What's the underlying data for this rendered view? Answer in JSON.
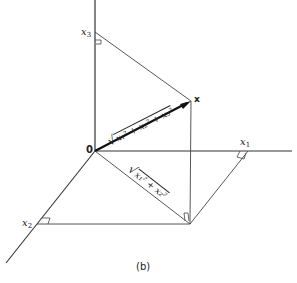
{
  "figure": {
    "caption": "(b)",
    "origin_label": "0",
    "point_label": "x",
    "axes": {
      "x1": {
        "label": "x",
        "sub": "1"
      },
      "x2": {
        "label": "x",
        "sub": "2"
      },
      "x3": {
        "label": "x",
        "sub": "3"
      }
    },
    "vector_length_label": {
      "radical": "√",
      "expr": "x₁² + x₂² + x₃²"
    },
    "projection_length_label": {
      "radical": "√",
      "expr": "x₁² + x₂²"
    },
    "colors": {
      "line": "#333333",
      "vector": "#111111",
      "background": "#ffffff"
    }
  }
}
